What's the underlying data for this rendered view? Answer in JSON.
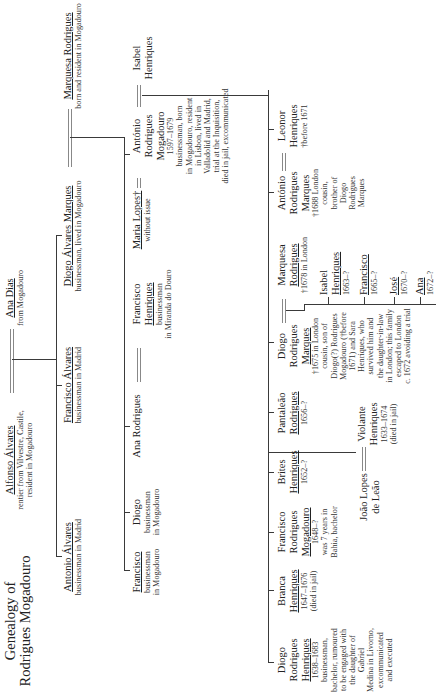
{
  "title": "Genealogy of Rodrigues Mogadouro",
  "title_lines": [
    "Genealogy of",
    "Rodrigues Mogadouro"
  ],
  "generation1": {
    "alfonso": {
      "name": "Alfonso Álvares",
      "desc": [
        "rentier from Vilvestre, Castile,",
        "resident in Mogadouro"
      ]
    },
    "ana_dias": {
      "name": "Ana Dias",
      "desc": [
        "from Mogadouro"
      ]
    }
  },
  "generation2": {
    "antonio_alvares": {
      "name": "Antonio Álvares",
      "desc": [
        "businessman in Madrid"
      ]
    },
    "francisco_alvares": {
      "name": "Francisco Álvares",
      "desc": [
        "businessman in Madrid"
      ]
    },
    "diogo_alvares_marques": {
      "name": "Diogo Álvares Marques",
      "desc": [
        "businessman, lived in Mogadouro"
      ]
    },
    "marquesa_rodrigues": {
      "name": "Marquesa Rodrigues",
      "desc": [
        "born and resident in Mogadouro"
      ]
    }
  },
  "generation3": {
    "francisco": {
      "name": "Francisco",
      "desc": [
        "businessman",
        "in Mogadouro"
      ]
    },
    "diogo": {
      "name": "Diogo",
      "desc": [
        "businessman",
        "in Mogadouro"
      ]
    },
    "ana_rodrigues": {
      "name": "Ana Rodrigues",
      "desc": []
    },
    "francisco_henriques": {
      "name_lines": [
        "Francisco",
        "Henriques"
      ],
      "desc": [
        "businessman",
        "in Miranda do Douro"
      ]
    },
    "maria_lopes": {
      "name": "Maria Lopes†",
      "desc": [
        "without issue"
      ]
    },
    "antonio_rodrigues_mogadouro": {
      "name_lines": [
        "António",
        "Rodrigues",
        "Mogadouro"
      ],
      "desc": [
        "1597–1679",
        "businessman, born",
        "in Mogadouro, resident",
        "in Lisbon, lived in",
        "Valladolid and Madrid,",
        "trial at the Inquisition,",
        "died in jail, excommunicated"
      ]
    },
    "isabel_henriques": {
      "name_lines": [
        "Isabel",
        "Henriques"
      ],
      "desc": []
    }
  },
  "generation4": {
    "diogo_rodrigues_henriques": {
      "name_lines": [
        "Diogo",
        "Rodrigues",
        "Henriques"
      ],
      "desc": [
        "1638–1683",
        "businessman,",
        "bachelor, rumoured",
        "to be engaged with",
        "the daughter of Gabriel",
        "Medina in Livorno,",
        "excommunicated",
        "and executed"
      ]
    },
    "branca_henriques": {
      "name_lines": [
        "Branca",
        "Henriques"
      ],
      "desc": [
        "1647–1676",
        "(died in jail)"
      ]
    },
    "francisco_rodrigues_mogadouro": {
      "name_lines": [
        "Francisco",
        "Rodrigues",
        "Mogadouro"
      ],
      "desc": [
        "1648–?",
        "was 7 years in",
        "Bahia, bachelor"
      ]
    },
    "brites_henriques": {
      "name_lines": [
        "Brites",
        "Henriques"
      ],
      "desc": [
        "1652–?"
      ]
    },
    "pantaleao_rodrigues": {
      "name_lines": [
        "Pantaleão",
        "Rodrigues"
      ],
      "desc": [
        "1656–?"
      ]
    },
    "diogo_rodrigues_marques": {
      "name_lines": [
        "Diogo",
        "Rodrigues",
        "Marques"
      ],
      "desc": [
        "†1675 in London",
        "cousin, son of",
        "Diogo(?) Rodrigues",
        "Mogadouro (†before",
        "1671) and Sara",
        "Henriques, who",
        "survived him and",
        "the daughter-in-law",
        "in London; this family",
        "escaped to London",
        "c. 1672 avoiding a trial"
      ]
    },
    "marquesa_rodrigues": {
      "name_lines": [
        "Marquesa",
        "Rodrigues"
      ],
      "desc": [
        "†1678 in London"
      ]
    },
    "antonio_rodrigues_marques": {
      "name_lines": [
        "António",
        "Rodrigues",
        "Marques"
      ],
      "desc": [
        "†1688 London",
        "cousin,",
        "brother of",
        "Diogo",
        "Rodrigues",
        "Marques"
      ]
    },
    "leonor_henriques": {
      "name_lines": [
        "Leonor",
        "Henriques"
      ],
      "desc": [
        "†before 1671"
      ]
    },
    "joao_lopes_de_leao": {
      "name_lines": [
        "João Lopes",
        "de Leão"
      ],
      "desc": []
    },
    "violante_henriques": {
      "name_lines": [
        "Violante",
        "Henriques"
      ],
      "desc": [
        "1633–1674",
        "(died in jail)"
      ]
    }
  },
  "generation5": {
    "isabel_henriques": {
      "name_lines": [
        "Isabel",
        "Henriques"
      ],
      "desc": [
        "1663–?"
      ]
    },
    "francisco": {
      "name": "Francisco",
      "desc": [
        "1665–?"
      ]
    },
    "jose": {
      "name": "José",
      "desc": [
        "1670–?"
      ]
    },
    "ana": {
      "name": "Ana",
      "desc": [
        "1672–?"
      ]
    }
  },
  "colors": {
    "line": "#3a3a3a",
    "marriage_line": "#888888",
    "text": "#222222",
    "background": "#ffffff"
  }
}
